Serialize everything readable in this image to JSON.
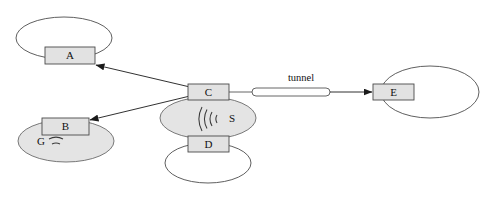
{
  "diagram": {
    "type": "network-topology",
    "background_color": "#ffffff",
    "stroke_color": "#555555",
    "node_fill": "#e2e2e2",
    "cloud_fill_shaded": "#e4e4e4",
    "cloud_fill_plain": "#ffffff",
    "nodes": [
      {
        "id": "A",
        "label": "A",
        "x": 45,
        "y": 47,
        "w": 50,
        "h": 17
      },
      {
        "id": "B",
        "label": "B",
        "x": 42,
        "y": 118,
        "w": 47,
        "h": 17
      },
      {
        "id": "C",
        "label": "C",
        "x": 188,
        "y": 84,
        "w": 41,
        "h": 16
      },
      {
        "id": "D",
        "label": "D",
        "x": 188,
        "y": 136,
        "w": 41,
        "h": 16
      },
      {
        "id": "E",
        "label": "E",
        "x": 373,
        "y": 84,
        "w": 41,
        "h": 16
      }
    ],
    "zones": [
      {
        "id": "zone-a",
        "label": "",
        "cx": 64,
        "cy": 38,
        "rx": 48,
        "ry": 21,
        "shaded": false
      },
      {
        "id": "zone-b",
        "label": "G",
        "cx": 66,
        "cy": 141,
        "rx": 48,
        "ry": 21,
        "shaded": true
      },
      {
        "id": "zone-c",
        "label": "S",
        "cx": 208,
        "cy": 118,
        "rx": 48,
        "ry": 21,
        "shaded": true
      },
      {
        "id": "zone-d",
        "label": "",
        "cx": 208,
        "cy": 163,
        "rx": 43,
        "ry": 20,
        "shaded": false
      },
      {
        "id": "zone-e",
        "label": "",
        "cx": 430,
        "cy": 92,
        "rx": 49,
        "ry": 26,
        "shaded": false
      }
    ],
    "wireless_symbols": [
      {
        "id": "wireless-g",
        "label": "G",
        "direction": "up"
      },
      {
        "id": "wireless-s",
        "label": "S",
        "direction": "left"
      }
    ],
    "edges": [
      {
        "id": "edge-c-to-a",
        "from": "C",
        "to": "A",
        "arrow": true,
        "label": ""
      },
      {
        "id": "edge-c-to-b",
        "from": "C",
        "to": "B",
        "arrow": true,
        "label": ""
      },
      {
        "id": "edge-c-to-e",
        "from": "C",
        "to": "E",
        "arrow": true,
        "label": "tunnel"
      }
    ],
    "labels": {
      "tunnel": "tunnel",
      "node_a": "A",
      "node_b": "B",
      "node_c": "C",
      "node_d": "D",
      "node_e": "E",
      "zone_g": "G",
      "zone_s": "S"
    }
  }
}
